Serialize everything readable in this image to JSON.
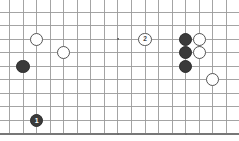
{
  "diagram": {
    "kind": "go-board-diagram",
    "board": {
      "columns": 17,
      "rows": 10,
      "origin_x": 9.5,
      "origin_y": 12.0,
      "spacing": 13.55,
      "line_color": "#9a9a9a",
      "edge_color": "#777777",
      "background_color": "#ffffff",
      "edges": {
        "bottom_is_board_edge": true,
        "top_is_board_edge": false,
        "left_is_board_edge": false,
        "right_is_board_edge": false
      },
      "star_points": [
        {
          "col": 8,
          "row": 9
        },
        {
          "col": 13,
          "row": 9
        },
        {
          "col": 8,
          "row": 2
        }
      ],
      "star_point_color": "#6d6d6d"
    },
    "stone_colors": {
      "black_fill": "#3a3a3a",
      "black_stroke": "#2c2c2c",
      "black_label": "#ffffff",
      "white_fill": "#ffffff",
      "white_stroke": "#555555",
      "white_label": "#444444"
    },
    "stone_radius": 6.6,
    "stones": [
      {
        "id": "w-a",
        "color": "white",
        "col": 2,
        "row": 2,
        "label": ""
      },
      {
        "id": "w-b",
        "color": "white",
        "col": 4,
        "row": 3,
        "label": ""
      },
      {
        "id": "b-a",
        "color": "black",
        "col": 1,
        "row": 4,
        "label": ""
      },
      {
        "id": "w-move-2",
        "color": "white",
        "col": 10,
        "row": 2,
        "label": "2"
      },
      {
        "id": "b-c1",
        "color": "black",
        "col": 13,
        "row": 2,
        "label": ""
      },
      {
        "id": "b-c2",
        "color": "black",
        "col": 13,
        "row": 3,
        "label": ""
      },
      {
        "id": "b-c3",
        "color": "black",
        "col": 13,
        "row": 4,
        "label": ""
      },
      {
        "id": "w-c1",
        "color": "white",
        "col": 14,
        "row": 2,
        "label": ""
      },
      {
        "id": "w-c2",
        "color": "white",
        "col": 14,
        "row": 3,
        "label": ""
      },
      {
        "id": "w-d",
        "color": "white",
        "col": 15,
        "row": 5,
        "label": ""
      },
      {
        "id": "b-move-1",
        "color": "black",
        "col": 2,
        "row": 8,
        "label": "1"
      }
    ]
  }
}
